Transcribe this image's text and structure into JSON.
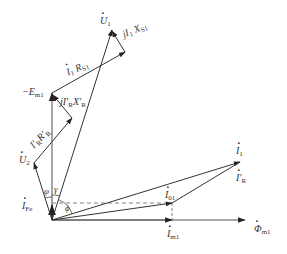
{
  "diagram": {
    "type": "phasor-diagram",
    "colors": {
      "line": "#333333",
      "axis": "#555555",
      "dashed": "#666666",
      "background": "#ffffff"
    },
    "phasors": [
      {
        "id": "U1",
        "from": [
          52,
          220
        ],
        "to": [
          112,
          30
        ]
      },
      {
        "id": "neg_Em1",
        "from": [
          52,
          220
        ],
        "to": [
          52,
          93
        ]
      },
      {
        "id": "U2",
        "from": [
          52,
          220
        ],
        "to": [
          34,
          163
        ]
      },
      {
        "id": "IR_RR",
        "from": [
          34,
          163
        ],
        "to": [
          72,
          118
        ]
      },
      {
        "id": "jIR_XR",
        "from": [
          72,
          118
        ],
        "to": [
          52,
          93
        ]
      },
      {
        "id": "I1_RS1",
        "from": [
          52,
          93
        ],
        "to": [
          125,
          52
        ]
      },
      {
        "id": "jI1_XS1",
        "from": [
          125,
          52
        ],
        "to": [
          112,
          30
        ]
      },
      {
        "id": "I1",
        "from": [
          52,
          220
        ],
        "to": [
          240,
          162
        ]
      },
      {
        "id": "IR",
        "from": [
          172,
          203
        ],
        "to": [
          240,
          162
        ]
      },
      {
        "id": "I01",
        "from": [
          52,
          220
        ],
        "to": [
          172,
          203
        ]
      },
      {
        "id": "Im1",
        "from": [
          52,
          220
        ],
        "to": [
          172,
          220
        ]
      },
      {
        "id": "Phi_m1",
        "from": [
          52,
          220
        ],
        "to": [
          245,
          220
        ]
      },
      {
        "id": "IFe",
        "from": [
          52,
          220
        ],
        "to": [
          52,
          203
        ]
      }
    ],
    "dashed": [
      {
        "from": [
          52,
          203
        ],
        "to": [
          172,
          203
        ]
      },
      {
        "from": [
          172,
          203
        ],
        "to": [
          172,
          220
        ]
      }
    ],
    "labels": {
      "U1": {
        "main": "U",
        "sub": "1"
      },
      "jI1XS1": {
        "main": "jI",
        "sub1": "1",
        "mid": " X",
        "sub2": "S1"
      },
      "I1RS1": {
        "main": "I",
        "sub1": "1",
        "mid": " R",
        "sub2": "S1"
      },
      "negEm1": {
        "main": "−E",
        "sub": "m1"
      },
      "jIRXR": {
        "main": "jI′",
        "sub1": "R",
        "mid": "X′",
        "sub2": "R"
      },
      "IRRR": {
        "main": "I′",
        "sub1": "R",
        "mid": "R′",
        "sub2": "R"
      },
      "U2": {
        "main": "U",
        "sub": "2"
      },
      "phi2": "φ",
      "gamma": "γ",
      "IFe": {
        "main": "I",
        "sub": "Fe"
      },
      "phi": "ϕ",
      "I01": {
        "main": "I",
        "sub": "01"
      },
      "Im1": {
        "main": "I",
        "sub": "m1"
      },
      "Phim1": {
        "main": "Φ",
        "sub": "m1"
      },
      "I1": {
        "main": "I",
        "sub": "1"
      },
      "IR": {
        "main": "I′",
        "sub": "R"
      }
    }
  }
}
